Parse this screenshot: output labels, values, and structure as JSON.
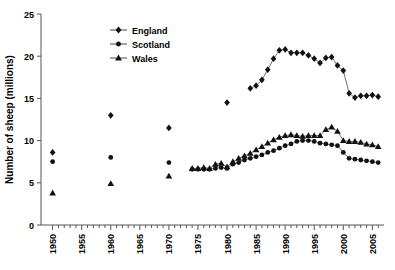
{
  "chart_data": {
    "type": "scatter",
    "title": "",
    "xlabel": "",
    "ylabel": "Number of sheep (millions)",
    "xlim": [
      1948,
      2007
    ],
    "ylim": [
      0,
      25
    ],
    "xticks": [
      1950,
      1955,
      1960,
      1965,
      1970,
      1975,
      1980,
      1985,
      1990,
      1995,
      2000,
      2005
    ],
    "xtick_labels": [
      "1950",
      "1955",
      "1960",
      "1965",
      "1970",
      "1975",
      "1980",
      "1985",
      "1990",
      "1995",
      "2000",
      "2005"
    ],
    "yticks": [
      0,
      5,
      10,
      15,
      20,
      25
    ],
    "ytick_labels": [
      "0",
      "5",
      "10",
      "15",
      "20",
      "25"
    ],
    "minor_xtick_interval": 1,
    "grid": false,
    "legend_position": "top-center",
    "marker_color": "#111111",
    "line_color": "#333333",
    "axis_color": "#555555",
    "series": [
      {
        "name": "England",
        "marker": "diamond",
        "x": [
          1950,
          1960,
          1970,
          1980,
          1984,
          1985,
          1986,
          1987,
          1988,
          1989,
          1990,
          1991,
          1992,
          1993,
          1994,
          1995,
          1996,
          1997,
          1998,
          1999,
          2000,
          2001,
          2002,
          2003,
          2004,
          2005,
          2006
        ],
        "y": [
          8.6,
          13.0,
          11.5,
          14.5,
          16.2,
          16.5,
          17.2,
          18.4,
          19.7,
          20.7,
          20.8,
          20.4,
          20.4,
          20.4,
          20.1,
          19.7,
          19.2,
          19.8,
          19.9,
          18.9,
          18.3,
          15.6,
          15.1,
          15.3,
          15.3,
          15.4,
          15.2
        ],
        "notes": "sparse decadal points 1950-1980, then annual from 1984"
      },
      {
        "name": "Scotland",
        "marker": "circle",
        "x": [
          1950,
          1960,
          1970,
          1974,
          1975,
          1976,
          1977,
          1978,
          1979,
          1980,
          1981,
          1982,
          1983,
          1984,
          1985,
          1986,
          1987,
          1988,
          1989,
          1990,
          1991,
          1992,
          1993,
          1994,
          1995,
          1996,
          1997,
          1998,
          1999,
          2000,
          2001,
          2002,
          2003,
          2004,
          2005,
          2006
        ],
        "y": [
          7.5,
          8.0,
          7.4,
          6.6,
          6.6,
          6.6,
          6.6,
          6.7,
          6.8,
          6.7,
          7.2,
          7.4,
          7.7,
          7.9,
          8.1,
          8.3,
          8.6,
          8.8,
          9.1,
          9.4,
          9.6,
          9.9,
          10.0,
          10.0,
          9.9,
          9.7,
          9.6,
          9.5,
          9.4,
          8.6,
          7.9,
          7.8,
          7.7,
          7.6,
          7.5,
          7.4
        ],
        "notes": "sparse decadal points 1950-1970, then annual from 1974"
      },
      {
        "name": "Wales",
        "marker": "triangle",
        "x": [
          1950,
          1960,
          1970,
          1974,
          1975,
          1976,
          1977,
          1978,
          1979,
          1980,
          1981,
          1982,
          1983,
          1984,
          1985,
          1986,
          1987,
          1988,
          1989,
          1990,
          1991,
          1992,
          1993,
          1994,
          1995,
          1996,
          1997,
          1998,
          1999,
          2000,
          2001,
          2002,
          2003,
          2004,
          2005,
          2006
        ],
        "y": [
          3.8,
          4.9,
          5.8,
          6.7,
          6.7,
          6.8,
          6.7,
          7.2,
          7.3,
          6.9,
          7.5,
          7.9,
          8.2,
          8.5,
          8.9,
          9.3,
          9.7,
          10.1,
          10.4,
          10.6,
          10.7,
          10.6,
          10.5,
          10.6,
          10.6,
          10.6,
          11.3,
          11.6,
          11.1,
          10.0,
          9.9,
          9.9,
          9.8,
          9.6,
          9.5,
          9.3
        ],
        "notes": "sparse decadal points 1950-1970, then annual from 1974"
      }
    ]
  },
  "legend": {
    "items": [
      {
        "label": "England",
        "marker": "diamond"
      },
      {
        "label": "Scotland",
        "marker": "circle"
      },
      {
        "label": "Wales",
        "marker": "triangle"
      }
    ]
  }
}
